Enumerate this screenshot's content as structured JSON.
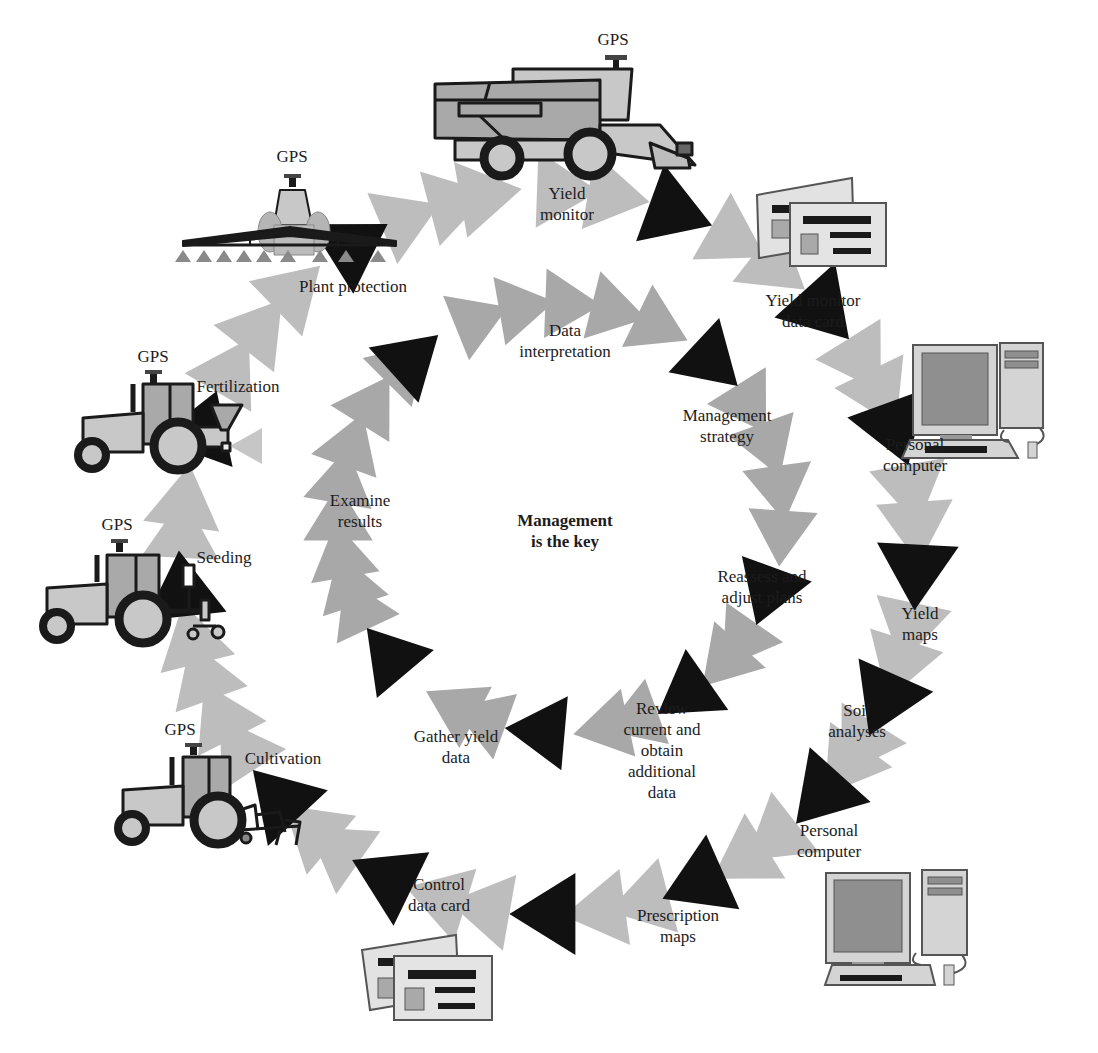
{
  "center_title": "Management\nis the key",
  "colors": {
    "arrow_dark": "#111111",
    "arrow_light": "#bdbdbd",
    "arrow_mid": "#a8a8a8",
    "vehicle_body": "#c8c8c8",
    "vehicle_cab": "#a9a9a9",
    "outline": "#1a1a1a",
    "screen": "#8f8f8f"
  },
  "gps_label": "GPS",
  "outer_cycle": {
    "center": [
      549,
      552
    ],
    "radius": [
      368,
      362
    ],
    "steps": [
      {
        "id": "yield-monitor",
        "label": "Yield\nmonitor",
        "x": 567,
        "y": 183
      },
      {
        "id": "yield-monitor-data-card",
        "label": "Yield monitor\ndata card",
        "x": 813,
        "y": 290
      },
      {
        "id": "personal-computer-1",
        "label": "Personal\ncomputer",
        "x": 915,
        "y": 434
      },
      {
        "id": "yield-maps",
        "label": "Yield\nmaps",
        "x": 920,
        "y": 603
      },
      {
        "id": "soil-analyses",
        "label": "Soil\nanalyses",
        "x": 857,
        "y": 700
      },
      {
        "id": "personal-computer-2",
        "label": "Personal\ncomputer",
        "x": 829,
        "y": 820
      },
      {
        "id": "prescription-maps",
        "label": "Prescription\nmaps",
        "x": 678,
        "y": 905
      },
      {
        "id": "control-data-card",
        "label": "Control\ndata card",
        "x": 439,
        "y": 874
      },
      {
        "id": "cultivation",
        "label": "Cultivation",
        "x": 283,
        "y": 748
      },
      {
        "id": "seeding",
        "label": "Seeding",
        "x": 224,
        "y": 547
      },
      {
        "id": "fertilization",
        "label": "Fertilization",
        "x": 238,
        "y": 376
      },
      {
        "id": "plant-protection",
        "label": "Plant protection",
        "x": 353,
        "y": 276
      }
    ],
    "dark_arrow_angles": [
      -70,
      -42,
      -20,
      3,
      24,
      42,
      66,
      90,
      116,
      137,
      174,
      200,
      238
    ],
    "light_arrow_angles": [
      -100,
      -88,
      -80,
      -60,
      -52,
      -32,
      -26,
      -10,
      -4,
      12,
      18,
      32,
      36,
      52,
      58,
      75,
      82,
      100,
      107,
      125,
      130,
      147,
      153,
      160,
      166,
      183,
      188,
      210,
      218,
      226,
      247,
      255
    ]
  },
  "inner_cycle": {
    "center": [
      560,
      518
    ],
    "radius": [
      222,
      214
    ],
    "steps": [
      {
        "id": "data-interpretation",
        "label": "Data\ninterpretation",
        "x": 565,
        "y": 320
      },
      {
        "id": "management-strategy",
        "label": "Management\nstrategy",
        "x": 727,
        "y": 405
      },
      {
        "id": "reassess-and-adjust-plans",
        "label": "Reassess and\nadjust plans",
        "x": 762,
        "y": 566
      },
      {
        "id": "review-current-and-obtain-additional-data",
        "label": "Review\ncurrent and\nobtain\nadditional\ndata",
        "x": 662,
        "y": 698
      },
      {
        "id": "gather-yield-data",
        "label": "Gather yield\ndata",
        "x": 456,
        "y": 726
      },
      {
        "id": "examine-results",
        "label": "Examine\nresults",
        "x": 360,
        "y": 490
      }
    ],
    "dark_arrow_angles": [
      -47,
      -132,
      20,
      55,
      95,
      140
    ],
    "light_arrow_angles": [
      -112,
      -100,
      -88,
      -76,
      -64,
      -32,
      -20,
      -8,
      4,
      35,
      42,
      70,
      78,
      110,
      118,
      155,
      162,
      170,
      180,
      190,
      200,
      212,
      225
    ]
  },
  "equipment": [
    {
      "id": "combine-harvester",
      "icon": "combine-harvester-icon",
      "gps": true,
      "gps_x": 613,
      "gps_y": 30
    },
    {
      "id": "sprayer",
      "icon": "sprayer-icon",
      "gps": true,
      "gps_x": 292,
      "gps_y": 147
    },
    {
      "id": "fertilizer-tractor",
      "icon": "fertilizer-tractor-icon",
      "gps": true,
      "gps_x": 153,
      "gps_y": 347
    },
    {
      "id": "seeding-tractor",
      "icon": "seeding-tractor-icon",
      "gps": true,
      "gps_x": 117,
      "gps_y": 515
    },
    {
      "id": "cultivation-tractor",
      "icon": "cultivation-tractor-icon",
      "gps": true,
      "gps_x": 180,
      "gps_y": 720
    },
    {
      "id": "yield-data-card",
      "icon": "data-card-icon",
      "gps": false
    },
    {
      "id": "pc-top",
      "icon": "personal-computer-icon",
      "gps": false
    },
    {
      "id": "pc-bottom",
      "icon": "personal-computer-icon",
      "gps": false
    },
    {
      "id": "control-card",
      "icon": "data-card-icon",
      "gps": false
    }
  ]
}
